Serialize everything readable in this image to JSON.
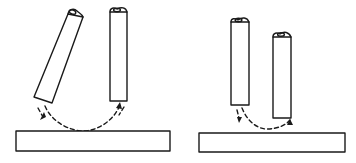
{
  "figure": {
    "colors": {
      "line": "#1a1a1a",
      "background": "#ffffff"
    },
    "panels": [
      {
        "id": "left-panel",
        "rods": [
          {
            "id": "tilted-rod",
            "orientation": "tilted"
          },
          {
            "id": "vertical-rod",
            "orientation": "vertical"
          }
        ],
        "base": "flat-bar",
        "arrow_path": "dashed-arc",
        "arrow_directions": [
          "down-left",
          "up"
        ]
      },
      {
        "id": "right-panel",
        "rods": [
          {
            "id": "tall-rod",
            "orientation": "vertical"
          },
          {
            "id": "short-rod",
            "orientation": "vertical"
          }
        ],
        "base": "flat-bar",
        "arrow_path": "dashed-arc",
        "arrow_directions": [
          "down",
          "up"
        ]
      }
    ]
  }
}
